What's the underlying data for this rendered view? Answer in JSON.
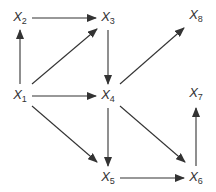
{
  "diagram": {
    "type": "directed-graph",
    "colors": {
      "edge": "#333333",
      "label": "#333333",
      "background": "#ffffff"
    },
    "nodes": [
      {
        "id": "X1",
        "base": "X",
        "sub": "1",
        "x": 20,
        "y": 96
      },
      {
        "id": "X2",
        "base": "X",
        "sub": "2",
        "x": 20,
        "y": 18
      },
      {
        "id": "X3",
        "base": "X",
        "sub": "3",
        "x": 108,
        "y": 18
      },
      {
        "id": "X4",
        "base": "X",
        "sub": "4",
        "x": 108,
        "y": 96
      },
      {
        "id": "X5",
        "base": "X",
        "sub": "5",
        "x": 108,
        "y": 178
      },
      {
        "id": "X6",
        "base": "X",
        "sub": "6",
        "x": 196,
        "y": 178
      },
      {
        "id": "X7",
        "base": "X",
        "sub": "7",
        "x": 196,
        "y": 94
      },
      {
        "id": "X8",
        "base": "X",
        "sub": "8",
        "x": 196,
        "y": 16
      }
    ],
    "edges": [
      {
        "from": "X1",
        "to": "X2",
        "x1": 20,
        "y1": 84,
        "x2": 20,
        "y2": 30
      },
      {
        "from": "X2",
        "to": "X3",
        "x1": 32,
        "y1": 18,
        "x2": 96,
        "y2": 18
      },
      {
        "from": "X1",
        "to": "X3",
        "x1": 32,
        "y1": 84,
        "x2": 97,
        "y2": 29
      },
      {
        "from": "X3",
        "to": "X4",
        "x1": 108,
        "y1": 30,
        "x2": 108,
        "y2": 84
      },
      {
        "from": "X1",
        "to": "X4",
        "x1": 32,
        "y1": 96,
        "x2": 96,
        "y2": 96
      },
      {
        "from": "X4",
        "to": "X8",
        "x1": 120,
        "y1": 84,
        "x2": 184,
        "y2": 28
      },
      {
        "from": "X1",
        "to": "X5",
        "x1": 32,
        "y1": 106,
        "x2": 97,
        "y2": 162
      },
      {
        "from": "X4",
        "to": "X5",
        "x1": 108,
        "y1": 108,
        "x2": 108,
        "y2": 166
      },
      {
        "from": "X4",
        "to": "X6",
        "x1": 120,
        "y1": 106,
        "x2": 185,
        "y2": 162
      },
      {
        "from": "X5",
        "to": "X6",
        "x1": 120,
        "y1": 178,
        "x2": 184,
        "y2": 178
      },
      {
        "from": "X6",
        "to": "X7",
        "x1": 196,
        "y1": 166,
        "x2": 196,
        "y2": 108
      }
    ]
  }
}
